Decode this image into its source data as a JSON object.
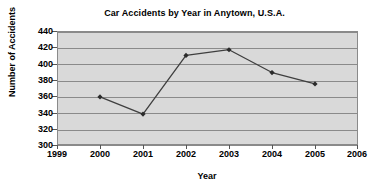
{
  "chart_data": {
    "type": "line",
    "title": "Car Accidents by Year in Anytown, U.S.A.",
    "xlabel": "Year",
    "ylabel": "Number of Accidents",
    "categories": [
      2000,
      2001,
      2002,
      2003,
      2004,
      2005
    ],
    "values": [
      359,
      338,
      410,
      417,
      389,
      375
    ],
    "series": [
      {
        "name": "Number of Accidents",
        "values": [
          359,
          338,
          410,
          417,
          389,
          375
        ]
      }
    ],
    "points": [
      {
        "x": 2000,
        "y": 359
      },
      {
        "x": 2001,
        "y": 338
      },
      {
        "x": 2002,
        "y": 410
      },
      {
        "x": 2003,
        "y": 417
      },
      {
        "x": 2004,
        "y": 389
      },
      {
        "x": 2005,
        "y": 375
      }
    ],
    "xlim": [
      1999,
      2006
    ],
    "ylim": [
      300,
      440
    ],
    "x_ticks": [
      1999,
      2000,
      2001,
      2002,
      2003,
      2004,
      2005,
      2006
    ],
    "y_ticks": [
      300,
      320,
      340,
      360,
      380,
      400,
      420,
      440
    ],
    "x_tick_labels": [
      "1999",
      "2000",
      "2001",
      "2002",
      "2003",
      "2004",
      "2005",
      "2006"
    ],
    "y_tick_labels": [
      "300",
      "320",
      "340",
      "360",
      "380",
      "400",
      "420",
      "440"
    ],
    "grid": true,
    "grid_axis": "y",
    "legend": false,
    "legend_position": "none",
    "marker": "diamond",
    "colors": {
      "plot_background": "#d9d9d9",
      "grid_line": "#8a8a8a",
      "axis_line": "#555555",
      "series_line": "#3f3f3f",
      "marker_fill": "#2b2b2b",
      "text": "#000000",
      "figure_background": "#ffffff"
    }
  }
}
